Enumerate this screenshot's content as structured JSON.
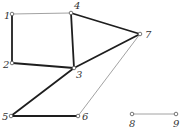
{
  "diagram": {
    "type": "undirected-graph",
    "colors": {
      "background": "#ffffff",
      "thick_edge": "#1e1e1e",
      "thin_edge": "#8a8a8a",
      "node_stroke": "#555555",
      "label": "#333333"
    },
    "nodes": [
      {
        "id": "1",
        "label": "1",
        "x": 12,
        "y": 14,
        "lx": 4,
        "ly": 19
      },
      {
        "id": "2",
        "label": "2",
        "x": 12,
        "y": 63,
        "lx": 3,
        "ly": 68
      },
      {
        "id": "3",
        "label": "3",
        "x": 74,
        "y": 68,
        "lx": 76,
        "ly": 78
      },
      {
        "id": "4",
        "label": "4",
        "x": 71,
        "y": 13,
        "lx": 74,
        "ly": 9
      },
      {
        "id": "5",
        "label": "5",
        "x": 11,
        "y": 116,
        "lx": 2,
        "ly": 120
      },
      {
        "id": "6",
        "label": "6",
        "x": 78,
        "y": 116,
        "lx": 82,
        "ly": 120
      },
      {
        "id": "7",
        "label": "7",
        "x": 140,
        "y": 34,
        "lx": 145,
        "ly": 38
      },
      {
        "id": "8",
        "label": "8",
        "x": 132,
        "y": 114,
        "lx": 129,
        "ly": 127
      },
      {
        "id": "9",
        "label": "9",
        "x": 176,
        "y": 114,
        "lx": 173,
        "ly": 127
      }
    ],
    "edges": [
      {
        "from": "1",
        "to": "4",
        "weight": "thin"
      },
      {
        "from": "1",
        "to": "2",
        "weight": "thick"
      },
      {
        "from": "2",
        "to": "3",
        "weight": "thick"
      },
      {
        "from": "4",
        "to": "3",
        "weight": "thick"
      },
      {
        "from": "4",
        "to": "7",
        "weight": "thick"
      },
      {
        "from": "3",
        "to": "7",
        "weight": "thick"
      },
      {
        "from": "3",
        "to": "5",
        "weight": "thick"
      },
      {
        "from": "5",
        "to": "6",
        "weight": "thick"
      },
      {
        "from": "6",
        "to": "7",
        "weight": "thin"
      },
      {
        "from": "8",
        "to": "9",
        "weight": "thin"
      }
    ]
  }
}
